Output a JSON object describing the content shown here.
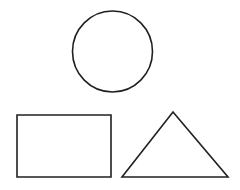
{
  "canvas": {
    "width": 240,
    "height": 190,
    "background_color": "#ffffff",
    "stroke_color": "#231f20",
    "stroke_width": 1.6,
    "fill": "none",
    "title": "Geometric shapes line drawing"
  },
  "shapes": [
    {
      "name": "circle",
      "type": "ellipse",
      "label": "Circle",
      "center_x": 112.5,
      "center_y": 51.5,
      "radius_x": 40,
      "radius_y": 40.5,
      "bounds": {
        "left": 72.5,
        "top": 11,
        "right": 152.5,
        "bottom": 92
      }
    },
    {
      "name": "rectangle",
      "type": "rect",
      "label": "Rectangle",
      "x": 17,
      "y": 115,
      "width": 94,
      "height": 62,
      "bounds": {
        "left": 17,
        "top": 115,
        "right": 111,
        "bottom": 177
      }
    },
    {
      "name": "triangle",
      "type": "polygon",
      "label": "Triangle",
      "points": "173,112 228,177 122,177",
      "vertices": [
        {
          "x": 173,
          "y": 112
        },
        {
          "x": 228,
          "y": 177
        },
        {
          "x": 122,
          "y": 177
        }
      ],
      "bounds": {
        "left": 122,
        "top": 112,
        "right": 228,
        "bottom": 177
      }
    }
  ]
}
